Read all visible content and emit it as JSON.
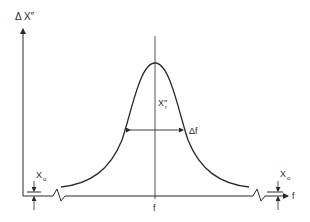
{
  "diagram": {
    "type": "resonance-curve",
    "y_axis_label": "Δ X″",
    "x_axis_label": "f",
    "center_label": "f",
    "peak_label": "X″",
    "peak_label_subscript": "r",
    "width_label": "Δf",
    "offset_label_left": "X",
    "offset_label_left_subscript": "o",
    "offset_label_right": "X",
    "offset_label_right_subscript": "o",
    "line_color": "#2a2a2a",
    "background": "#ffffff"
  }
}
